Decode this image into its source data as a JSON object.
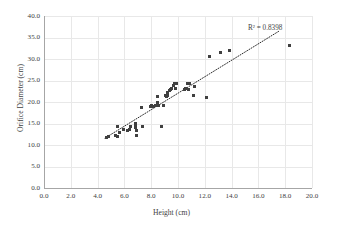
{
  "chart_data": {
    "type": "scatter",
    "title": "",
    "xlabel": "Height (cm)",
    "ylabel": "Orifice Diameter (cm)",
    "xlim": [
      0.0,
      20.0
    ],
    "ylim": [
      0.0,
      40.0
    ],
    "xticks": [
      "0.0",
      "2.0",
      "4.0",
      "6.0",
      "8.0",
      "10.0",
      "12.0",
      "14.0",
      "16.0",
      "18.0",
      "20.0"
    ],
    "yticks": [
      "0.0",
      "5.0",
      "10.0",
      "15.0",
      "20.0",
      "25.0",
      "30.0",
      "35.0",
      "40.0"
    ],
    "xtick_values": [
      0.0,
      2.0,
      4.0,
      6.0,
      8.0,
      10.0,
      12.0,
      14.0,
      16.0,
      18.0,
      20.0
    ],
    "ytick_values": [
      0.0,
      5.0,
      10.0,
      15.0,
      20.0,
      25.0,
      30.0,
      35.0,
      40.0
    ],
    "grid": true,
    "legend": "none",
    "marker_color": "#404040",
    "gridline_color": "#e8e8e8",
    "axis_color": "#a6a6a6",
    "annotations": [
      {
        "text": "R² = 0.8398",
        "x": 15.6,
        "y": 36.4
      }
    ],
    "trendline": {
      "style": "dotted",
      "color": "#2b2b2b",
      "x_start": 4.55,
      "y_start": 11.6,
      "x_end": 17.6,
      "y_end": 36.6
    },
    "points": [
      [
        4.7,
        11.8
      ],
      [
        4.85,
        11.9
      ],
      [
        5.35,
        12.1
      ],
      [
        5.45,
        14.2
      ],
      [
        5.5,
        12.0
      ],
      [
        5.6,
        12.9
      ],
      [
        5.95,
        13.6
      ],
      [
        6.25,
        13.4
      ],
      [
        6.35,
        13.7
      ],
      [
        6.45,
        14.3
      ],
      [
        6.8,
        15.1
      ],
      [
        6.82,
        14.6
      ],
      [
        6.85,
        14.0
      ],
      [
        6.88,
        13.3
      ],
      [
        6.9,
        12.3
      ],
      [
        6.92,
        12.1
      ],
      [
        7.25,
        18.8
      ],
      [
        7.35,
        14.4
      ],
      [
        7.95,
        19.0
      ],
      [
        8.05,
        19.1
      ],
      [
        8.15,
        18.9
      ],
      [
        8.35,
        19.2
      ],
      [
        8.45,
        21.2
      ],
      [
        8.5,
        19.9
      ],
      [
        8.55,
        19.1
      ],
      [
        8.8,
        14.2
      ],
      [
        8.95,
        19.2
      ],
      [
        9.1,
        21.6
      ],
      [
        9.15,
        21.3
      ],
      [
        9.2,
        22.2
      ],
      [
        9.25,
        21.4
      ],
      [
        9.35,
        22.6
      ],
      [
        9.45,
        23.0
      ],
      [
        9.55,
        23.2
      ],
      [
        9.65,
        23.9
      ],
      [
        9.72,
        24.3
      ],
      [
        9.78,
        23.1
      ],
      [
        9.9,
        24.2
      ],
      [
        10.45,
        22.9
      ],
      [
        10.55,
        23.1
      ],
      [
        10.7,
        24.4
      ],
      [
        10.75,
        23.0
      ],
      [
        10.85,
        24.4
      ],
      [
        11.15,
        21.4
      ],
      [
        11.25,
        23.5
      ],
      [
        12.1,
        21.1
      ],
      [
        12.35,
        30.6
      ],
      [
        13.2,
        31.5
      ],
      [
        13.85,
        31.9
      ],
      [
        18.3,
        33.2
      ]
    ]
  }
}
